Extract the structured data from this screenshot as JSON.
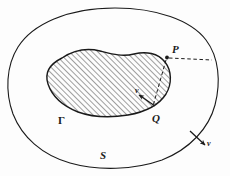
{
  "figure": {
    "background_color": "#fdfdfd",
    "stroke_color": "#1a1a1a",
    "hatch_color": "#2b2b2b",
    "labels": {
      "outer_boundary": "S",
      "inner_boundary": "Γ",
      "point_outer": "P",
      "point_on_inner": "Q",
      "normal_inner": "ν",
      "normal_outer": "ν"
    },
    "geometry": {
      "outer_curve_name": "S",
      "inner_region_name": "Γ",
      "inner_region_fill": "diagonal-hatch-45deg",
      "point_P": {
        "x": 167,
        "y": 57
      },
      "point_Q": {
        "x": 155,
        "y": 108
      },
      "dashed_segment_P_to_Q": true,
      "dashed_segment_P_to_S": true,
      "normal_arrow_at_Q_direction": "inward",
      "normal_arrow_at_S_direction": "outward"
    }
  }
}
